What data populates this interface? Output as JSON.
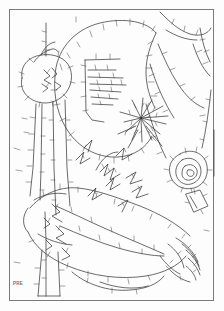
{
  "page": {
    "background_color": "#fdfdfd",
    "width": 224,
    "height": 311
  },
  "frame": {
    "name": "plate-border",
    "stroke_color": "#7a7a7a",
    "stroke_width": 1,
    "x": 9,
    "y": 9,
    "width": 205,
    "height": 292
  },
  "artwork": {
    "title": "",
    "caption": "",
    "type": "line-drawing",
    "description": "Contour tracing of a reclining figure with head, torso, arms and hands, drawn as outlines with perpendicular barb ticks",
    "line_color": "#3a3a3a",
    "barb_color": "#555555",
    "line_width": 0.7,
    "barb_width": 0.55,
    "motifs": [
      {
        "name": "head-contour",
        "label": ""
      },
      {
        "name": "face-hatching",
        "label": ""
      },
      {
        "name": "vertical-pole-lines",
        "label": ""
      },
      {
        "name": "radiating-fan-burst",
        "label": ""
      },
      {
        "name": "concentric-rosette",
        "label": ""
      },
      {
        "name": "small-lozenge",
        "label": ""
      },
      {
        "name": "reclining-torso",
        "label": ""
      },
      {
        "name": "hand-with-fingers",
        "label": ""
      },
      {
        "name": "leaf-sprays",
        "label": ""
      }
    ]
  },
  "watermark": {
    "text": "illegible",
    "tag": "PRE",
    "color": "#8a8a8a",
    "rotation_degrees": -90
  }
}
